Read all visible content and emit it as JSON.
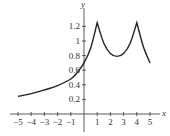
{
  "chart_data": {
    "type": "line",
    "title": "",
    "xlabel": "x",
    "ylabel": "y",
    "xlim": [
      -5,
      5
    ],
    "ylim": [
      0,
      1.3
    ],
    "grid": false,
    "legend": null,
    "x_ticks": [
      -5,
      -4,
      -3,
      -2,
      -1,
      1,
      2,
      3,
      4,
      5
    ],
    "x_tick_labels": [
      "−5",
      "−4",
      "−3",
      "−2",
      "−1",
      "1",
      "2",
      "3",
      "4",
      "5"
    ],
    "y_ticks": [
      0.2,
      0.4,
      0.6,
      0.8,
      1,
      1.2
    ],
    "y_tick_labels": [
      "0.2",
      "0.4",
      "0.6",
      "0.8",
      "1",
      "1.2"
    ],
    "series": [
      {
        "name": "f(x)",
        "color": "#222222",
        "x": [
          -5,
          -4,
          -3,
          -2,
          -1,
          -0.5,
          0,
          0.5,
          1,
          1.5,
          2,
          2.5,
          3,
          3.5,
          4,
          4.5,
          5
        ],
        "y": [
          0.24,
          0.28,
          0.33,
          0.39,
          0.48,
          0.57,
          0.7,
          0.9,
          1.25,
          0.97,
          0.83,
          0.79,
          0.83,
          0.97,
          1.25,
          0.92,
          0.7
        ]
      }
    ],
    "annotations": [
      "cusp at x=1, y≈1.25",
      "cusp at x=4, y≈1.25",
      "local minimum near x=2.5, y≈0.79"
    ]
  },
  "colors": {
    "axis": "#333333",
    "curve": "#222222",
    "background": "#ffffff"
  }
}
